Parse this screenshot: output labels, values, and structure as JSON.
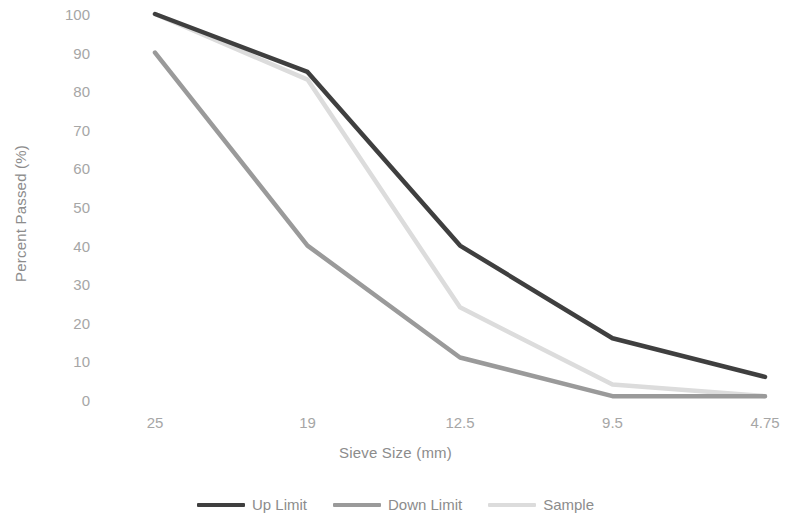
{
  "chart_data": {
    "type": "line",
    "title": "",
    "xlabel": "Sieve Size (mm)",
    "ylabel": "Percent Passed (%)",
    "categories": [
      "25",
      "19",
      "12.5",
      "9.5",
      "4.75"
    ],
    "ylim": [
      0,
      100
    ],
    "yticks": [
      "100",
      "90",
      "80",
      "70",
      "60",
      "50",
      "40",
      "30",
      "20",
      "10",
      "0"
    ],
    "ytick_values": [
      100,
      90,
      80,
      70,
      60,
      50,
      40,
      30,
      20,
      10,
      0
    ],
    "grid": false,
    "legend_position": "bottom",
    "series": [
      {
        "name": "Up Limit",
        "values": [
          100,
          85,
          40,
          16,
          6
        ],
        "color": "#3f3f3f"
      },
      {
        "name": "Down Limit",
        "values": [
          90,
          40,
          11,
          1,
          1
        ],
        "color": "#9a9a9a"
      },
      {
        "name": "Sample",
        "values": [
          100,
          83,
          24,
          4,
          1
        ],
        "color": "#dcdcdc"
      }
    ]
  },
  "axes": {
    "y_title": "Percent Passed (%)",
    "x_title": "Sieve Size (mm)"
  },
  "legend": {
    "items": [
      {
        "label": "Up Limit",
        "color": "#3f3f3f"
      },
      {
        "label": "Down Limit",
        "color": "#9a9a9a"
      },
      {
        "label": "Sample",
        "color": "#dcdcdc"
      }
    ]
  }
}
